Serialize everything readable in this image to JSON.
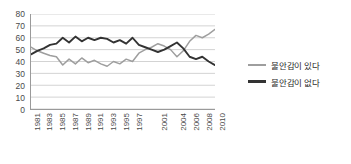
{
  "chart_data": {
    "type": "line",
    "title": "",
    "xlabel": "",
    "ylabel": "",
    "ylim": [
      0,
      80
    ],
    "ytick_step": 10,
    "yticks": [
      0,
      10,
      20,
      30,
      40,
      50,
      60,
      70,
      80
    ],
    "grid": true,
    "legend_position": "right",
    "x": [
      "1981",
      "1982",
      "1983",
      "1984",
      "1985",
      "1986",
      "1987",
      "1988",
      "1989",
      "1990",
      "1991",
      "1992",
      "1993",
      "1994",
      "1995",
      "1996",
      "1997",
      "1998",
      "1999",
      "2000",
      "2001",
      "2002",
      "2003",
      "2004",
      "2005",
      "2006",
      "2007",
      "2008",
      "2009",
      "2010"
    ],
    "xtick_labels": [
      "1981",
      "",
      "1983",
      "",
      "1985",
      "",
      "1987",
      "",
      "1989",
      "",
      "1991",
      "",
      "1993",
      "",
      "1995",
      "",
      "1997",
      "",
      "",
      "",
      "2001",
      "",
      "",
      "2004",
      "",
      "2006",
      "",
      "2008",
      "",
      "2010"
    ],
    "series": [
      {
        "name": "불안감이 있다",
        "color": "#9e9e9e",
        "values": [
          52,
          49,
          47,
          45,
          44,
          37,
          42,
          38,
          43,
          39,
          41,
          38,
          36,
          40,
          38,
          42,
          40,
          47,
          50,
          52,
          55,
          53,
          50,
          44,
          49,
          57,
          62,
          60,
          63,
          67
        ]
      },
      {
        "name": "불안감이 없다",
        "color": "#333333",
        "values": [
          46,
          49,
          51,
          54,
          55,
          60,
          56,
          61,
          57,
          60,
          58,
          60,
          59,
          56,
          58,
          55,
          60,
          54,
          52,
          50,
          48,
          50,
          53,
          56,
          51,
          44,
          42,
          44,
          40,
          37
        ]
      }
    ]
  },
  "legend": {
    "items": [
      {
        "label": "불안감이 있다",
        "color": "#9e9e9e",
        "width": "2.2px"
      },
      {
        "label": "불안감이 없다",
        "color": "#333333",
        "width": "3px"
      }
    ]
  }
}
